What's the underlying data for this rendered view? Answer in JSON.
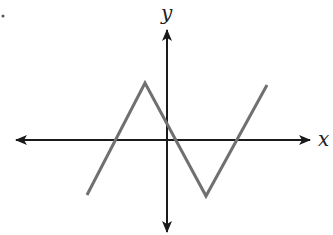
{
  "diagram": {
    "type": "coordinate-graph",
    "axes": {
      "x_label": "x",
      "y_label": "y",
      "axis_color": "#1a1a1a",
      "origin_px": [
        167,
        140
      ],
      "x_axis_px": {
        "from": [
          16,
          140
        ],
        "to": [
          310,
          140
        ]
      },
      "y_axis_px": {
        "from": [
          167,
          30
        ],
        "to": [
          167,
          232
        ]
      }
    },
    "curve": {
      "description": "piecewise linear zigzag (N-shape)",
      "color": "#707070",
      "points_px": [
        [
          87,
          195
        ],
        [
          145,
          83
        ],
        [
          206,
          196
        ],
        [
          267,
          85
        ]
      ],
      "x_intercepts_px": [
        115,
        172,
        237
      ],
      "y_intercept_px": 124
    },
    "marker": "•"
  }
}
